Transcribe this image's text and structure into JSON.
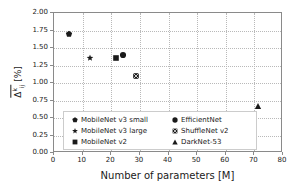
{
  "chart_data": {
    "type": "scatter",
    "title": "",
    "xlabel": "Number of parameters [M]",
    "ylabel": "Δ [%]",
    "ylabel_parts": {
      "delta": "Δ",
      "subscript": "ij",
      "superscript": "k",
      "units": "[%]"
    },
    "xlim": [
      0,
      80
    ],
    "ylim": [
      0.0,
      2.0
    ],
    "xticks": [
      "0",
      "10",
      "20",
      "30",
      "40",
      "50",
      "60",
      "70",
      "80"
    ],
    "xtick_values": [
      0,
      10,
      20,
      30,
      40,
      50,
      60,
      70,
      80
    ],
    "yticks": [
      "0.00",
      "0.25",
      "0.50",
      "0.75",
      "1.00",
      "1.25",
      "1.50",
      "1.75",
      "2.00"
    ],
    "ytick_values": [
      0.0,
      0.25,
      0.5,
      0.75,
      1.0,
      1.25,
      1.5,
      1.75,
      2.0
    ],
    "grid": true,
    "grid_style": "dotted",
    "legend_position": "lower-left",
    "marker_color": "#1a1a1a",
    "series": [
      {
        "name": "MobileNet v3 small",
        "marker": "pentagon",
        "x": 5.5,
        "y": 1.68
      },
      {
        "name": "MobileNet v3 large",
        "marker": "star",
        "x": 13.0,
        "y": 1.34
      },
      {
        "name": "MobileNet v2",
        "marker": "square",
        "x": 22.0,
        "y": 1.34
      },
      {
        "name": "EfficientNet",
        "marker": "circle",
        "x": 24.5,
        "y": 1.38
      },
      {
        "name": "ShuffleNet v2",
        "marker": "x-square",
        "x": 29.0,
        "y": 1.08
      },
      {
        "name": "DarkNet-53",
        "marker": "triangle",
        "x": 71.5,
        "y": 0.66
      }
    ]
  },
  "legend": {
    "left_column": [
      {
        "label": "MobileNet v3 small",
        "marker": "pentagon"
      },
      {
        "label": "MobileNet v3 large",
        "marker": "star"
      },
      {
        "label": "MobileNet v2",
        "marker": "square"
      }
    ],
    "right_column": [
      {
        "label": "EfficientNet",
        "marker": "circle"
      },
      {
        "label": "ShuffleNet v2",
        "marker": "x-square"
      },
      {
        "label": "DarkNet-53",
        "marker": "triangle"
      }
    ]
  }
}
